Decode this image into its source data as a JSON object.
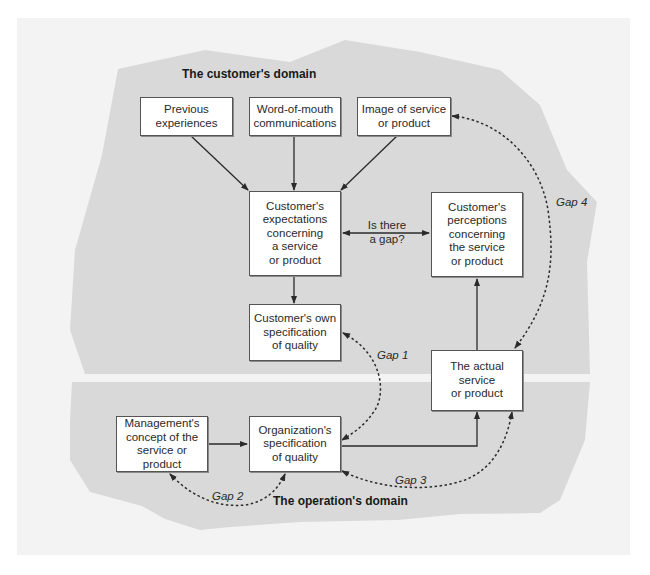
{
  "diagram": {
    "domains": {
      "customer": "The customer's domain",
      "operation": "The operation's domain"
    },
    "boxes": {
      "previous_experiences": "Previous\nexperiences",
      "word_of_mouth": "Word-of-mouth\ncommunications",
      "image": "Image of service\nor product",
      "expectations": "Customer's\nexpectations\nconcerning\na service\nor product",
      "perceptions": "Customer's\nperceptions\nconcerning\nthe service\nor product",
      "own_specification": "Customer's own\nspecification\nof quality",
      "actual_service": "The actual\nservice\nor product",
      "management_concept": "Management's\nconcept of the\nservice or product",
      "org_specification": "Organization's\nspecification\nof quality"
    },
    "gap_question": "Is there\na gap?",
    "gaps": {
      "gap1": "Gap 1",
      "gap2": "Gap 2",
      "gap3": "Gap 3",
      "gap4": "Gap 4"
    },
    "colors": {
      "region_fill": "#d9d9d9",
      "page_bg": "#f3f3f3",
      "box_fill": "#ffffff",
      "line": "#2a2a2a"
    }
  }
}
